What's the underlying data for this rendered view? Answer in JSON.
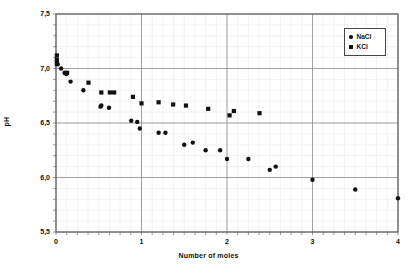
{
  "chart_data": {
    "type": "scatter",
    "title": "",
    "xlabel": "Number of moles",
    "ylabel": "pH",
    "xlim": [
      0,
      4
    ],
    "ylim": [
      5.5,
      7.5
    ],
    "xticks": [
      "0",
      "1",
      "2",
      "3",
      "4"
    ],
    "xtick_values": [
      0,
      1,
      2,
      3,
      4
    ],
    "yticks": [
      "7,5",
      "7,0",
      "6,5",
      "6,0",
      "5,5"
    ],
    "ytick_values": [
      7.5,
      7.0,
      6.5,
      6.0,
      5.5
    ],
    "grid": true,
    "grid_major": true,
    "grid_minor": true,
    "grid_minor_x_step": 0.125,
    "grid_minor_y_step": 0.1,
    "legend_position": "top-right",
    "series": [
      {
        "name": "NaCl",
        "marker": "circle",
        "color": "#111111",
        "points": [
          [
            0.01,
            7.07
          ],
          [
            0.02,
            7.04
          ],
          [
            0.06,
            7.0
          ],
          [
            0.1,
            6.96
          ],
          [
            0.12,
            6.95
          ],
          [
            0.17,
            6.88
          ],
          [
            0.32,
            6.8
          ],
          [
            0.52,
            6.65
          ],
          [
            0.53,
            6.66
          ],
          [
            0.62,
            6.64
          ],
          [
            0.88,
            6.52
          ],
          [
            0.95,
            6.51
          ],
          [
            0.98,
            6.45
          ],
          [
            1.2,
            6.41
          ],
          [
            1.28,
            6.41
          ],
          [
            1.5,
            6.3
          ],
          [
            1.6,
            6.32
          ],
          [
            1.75,
            6.25
          ],
          [
            1.92,
            6.25
          ],
          [
            2.0,
            6.17
          ],
          [
            2.25,
            6.17
          ],
          [
            2.5,
            6.07
          ],
          [
            2.57,
            6.1
          ],
          [
            3.0,
            5.98
          ],
          [
            3.5,
            5.89
          ],
          [
            4.0,
            5.81
          ]
        ]
      },
      {
        "name": "KCl",
        "marker": "square",
        "color": "#111111",
        "points": [
          [
            0.01,
            7.12
          ],
          [
            0.01,
            7.08
          ],
          [
            0.01,
            7.04
          ],
          [
            0.11,
            6.96
          ],
          [
            0.13,
            6.96
          ],
          [
            0.38,
            6.87
          ],
          [
            0.53,
            6.78
          ],
          [
            0.63,
            6.78
          ],
          [
            0.68,
            6.78
          ],
          [
            0.9,
            6.74
          ],
          [
            1.0,
            6.68
          ],
          [
            1.2,
            6.69
          ],
          [
            1.37,
            6.67
          ],
          [
            1.52,
            6.66
          ],
          [
            1.78,
            6.63
          ],
          [
            2.03,
            6.57
          ],
          [
            2.08,
            6.61
          ],
          [
            2.38,
            6.59
          ]
        ]
      }
    ]
  },
  "legend": {
    "items": [
      {
        "label": "NaCl",
        "marker": "circle"
      },
      {
        "label": "KCl",
        "marker": "square"
      }
    ]
  },
  "background_artifacts": {
    "line1": "",
    "line2": "",
    "line3": "",
    "line4": "",
    "line5": ""
  }
}
